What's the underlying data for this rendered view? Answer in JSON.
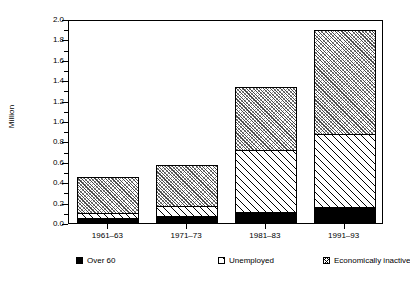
{
  "chart_data": {
    "type": "bar",
    "subtype": "stacked-bar",
    "title": "",
    "xlabel": "",
    "ylabel": "Million",
    "ylim": [
      0.0,
      2.0
    ],
    "ytick_step": 0.2,
    "yminor_step": 0.1,
    "grid": false,
    "legend_position": "bottom",
    "categories": [
      "1961–63",
      "1971–73",
      "1981–83",
      "1991–93"
    ],
    "ytick_labels": [
      "0.0",
      "0.2",
      "0.4",
      "0.6",
      "0.8",
      "1.0",
      "1.2",
      "1.4",
      "1.6",
      "1.8",
      "2.0"
    ],
    "ytick_values": [
      0.0,
      0.2,
      0.4,
      0.6,
      0.8,
      1.0,
      1.2,
      1.4,
      1.6,
      1.8,
      2.0
    ],
    "series": [
      {
        "name": "Over 60",
        "pattern": "solid-black",
        "values": [
          0.05,
          0.07,
          0.11,
          0.16
        ]
      },
      {
        "name": "Unemployed",
        "pattern": "light-diagonal-hatch",
        "values": [
          0.05,
          0.1,
          0.61,
          0.71
        ]
      },
      {
        "name": "Economically inactive",
        "pattern": "dense-cross-hatch",
        "values": [
          0.35,
          0.4,
          0.61,
          1.02
        ]
      }
    ],
    "totals": [
      0.45,
      0.57,
      1.33,
      1.89
    ],
    "segment_tops": [
      [
        0.05,
        0.1,
        0.45
      ],
      [
        0.07,
        0.17,
        0.57
      ],
      [
        0.11,
        0.72,
        1.33
      ],
      [
        0.16,
        0.87,
        1.89
      ]
    ]
  },
  "legend": {
    "items": [
      {
        "label": "Over 60"
      },
      {
        "label": "Unemployed"
      },
      {
        "label": "Economically inactive"
      }
    ]
  }
}
